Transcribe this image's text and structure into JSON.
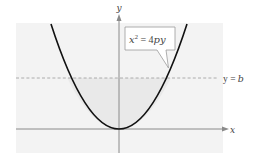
{
  "diagram": {
    "type": "parabola-graph",
    "axes": {
      "x_label": "x",
      "y_label": "y"
    },
    "curve": {
      "equation_lhs": "x",
      "equation_exp": "2",
      "equation_rhs": " = 4",
      "equation_rhs_italic": "py",
      "equation_full": "x^2 = 4py"
    },
    "horizontal_line": {
      "label_var": "y",
      "label_eq": " = ",
      "label_val": "b",
      "label_full": "y = b",
      "style": "dashed"
    },
    "colors": {
      "panel_background": "#f3f3f3",
      "inner_region": "#ebebeb",
      "axis": "#8a8a8a",
      "curve": "#111111",
      "dashed_line": "#9a9a9a",
      "label_box_border": "#9a9a9a",
      "label_box_fill": "#ffffff"
    }
  }
}
